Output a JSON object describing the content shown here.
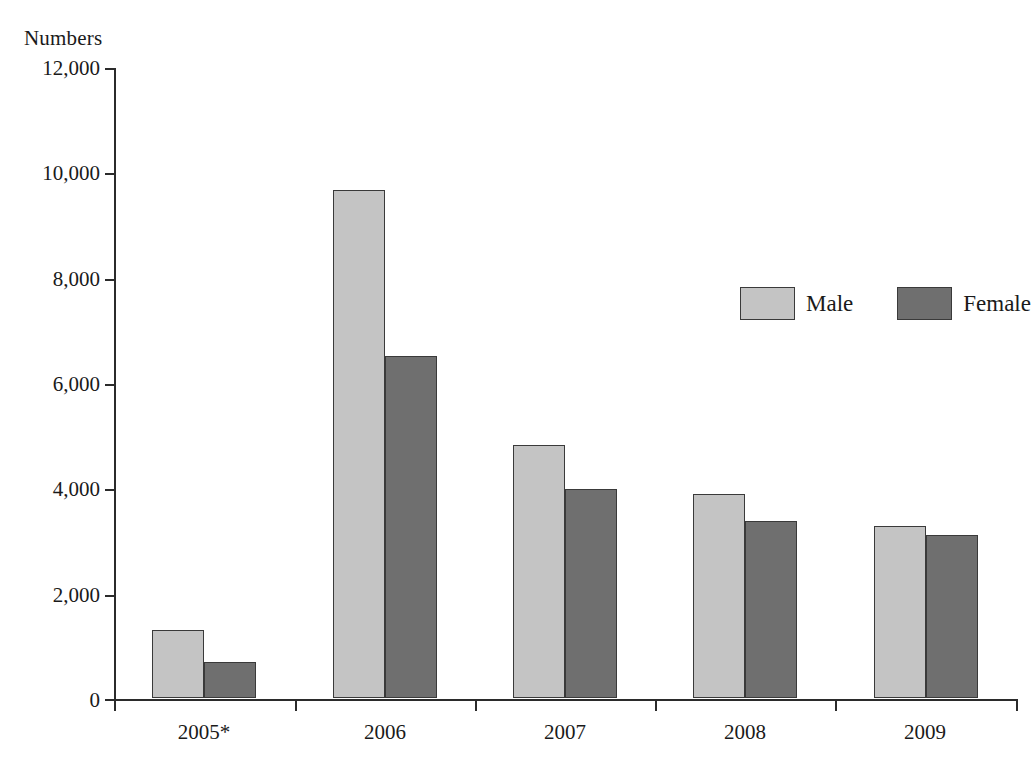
{
  "chart_data": {
    "type": "bar",
    "title": "",
    "ylabel": "Numbers",
    "xlabel": "",
    "categories": [
      "2005*",
      "2006",
      "2007",
      "2008",
      "2009"
    ],
    "series": [
      {
        "name": "Male",
        "color": "#c4c4c4",
        "values": [
          1300,
          9650,
          4800,
          3880,
          3270
        ]
      },
      {
        "name": "Female",
        "color": "#6f6f6f",
        "values": [
          680,
          6500,
          3970,
          3370,
          3090
        ]
      }
    ],
    "ylim": [
      0,
      12000
    ],
    "ytick_labels": [
      "12,000",
      "10,000",
      "8,000",
      "6,000",
      "4,000",
      "2,000",
      "0"
    ],
    "ytick_values": [
      12000,
      10000,
      8000,
      6000,
      4000,
      2000,
      0
    ],
    "grid": false,
    "legend_position": "upper right",
    "legend_entries": [
      "Male",
      "Female"
    ]
  }
}
